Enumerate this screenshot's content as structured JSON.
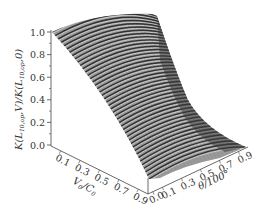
{
  "chart_data": {
    "type": "surface3d",
    "title": "",
    "zlabel": "K(L_{10,op},V)/K(L_{10,op},0)",
    "xlabel": "V/C",
    "ylabel": "θ/100°",
    "z_ticks": [
      "0.0",
      "0.2",
      "0.4",
      "0.6",
      "0.8",
      "1.0"
    ],
    "x_ticks": [
      "0.1",
      "0.3",
      "0.5",
      "0.7",
      "0.9"
    ],
    "y_ticks": [
      "0.0",
      "0.1",
      "0.3",
      "0.5",
      "0.7",
      "0.9"
    ],
    "zlim": [
      0.0,
      1.0
    ],
    "xlim": [
      0.0,
      1.0
    ],
    "ylim": [
      0.0,
      0.9
    ],
    "grid": false,
    "legend": null,
    "series": [
      {
        "name": "θ=0.0",
        "x": [
          0.0,
          0.1,
          0.3,
          0.5,
          0.7,
          0.9
        ],
        "values": [
          1.0,
          0.93,
          0.75,
          0.5,
          0.25,
          0.05
        ]
      },
      {
        "name": "θ=0.5",
        "x": [
          0.0,
          0.1,
          0.3,
          0.5,
          0.7,
          0.9
        ],
        "values": [
          1.0,
          0.97,
          0.85,
          0.62,
          0.35,
          0.15
        ]
      },
      {
        "name": "θ=0.9",
        "x": [
          0.0,
          0.1,
          0.3,
          0.5,
          0.7,
          0.9
        ],
        "values": [
          1.0,
          0.98,
          0.9,
          0.7,
          0.3,
          0.0
        ]
      }
    ]
  },
  "axes": {
    "z_title_main": "K(L",
    "z_title_sub1": "10,op",
    "z_title_mid": ",V)/K(L",
    "z_title_sub2": "10,op",
    "z_title_end": ",0)",
    "x_title_main": "V",
    "x_title_sub": "0",
    "x_title_end": "/C",
    "x_title_sub2": "0",
    "y_title": "θ/100°"
  }
}
